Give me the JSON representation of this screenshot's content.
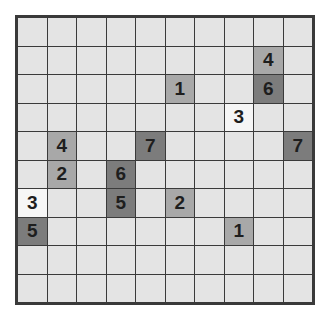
{
  "puzzle": {
    "rows": 10,
    "cols": 10,
    "colors": {
      "empty": "#e4e4e4",
      "white": "#f6f6f6",
      "medium": "#a8a8a8",
      "dark": "#7c7c7c",
      "border": "#3a3a3a"
    },
    "clues": [
      {
        "row": 1,
        "col": 8,
        "value": "4",
        "shade": "medium"
      },
      {
        "row": 2,
        "col": 5,
        "value": "1",
        "shade": "medium"
      },
      {
        "row": 2,
        "col": 8,
        "value": "6",
        "shade": "dark"
      },
      {
        "row": 3,
        "col": 7,
        "value": "3",
        "shade": "white"
      },
      {
        "row": 4,
        "col": 1,
        "value": "4",
        "shade": "medium"
      },
      {
        "row": 4,
        "col": 4,
        "value": "7",
        "shade": "dark"
      },
      {
        "row": 4,
        "col": 9,
        "value": "7",
        "shade": "dark"
      },
      {
        "row": 5,
        "col": 1,
        "value": "2",
        "shade": "medium"
      },
      {
        "row": 5,
        "col": 3,
        "value": "6",
        "shade": "dark"
      },
      {
        "row": 6,
        "col": 0,
        "value": "3",
        "shade": "white"
      },
      {
        "row": 6,
        "col": 3,
        "value": "5",
        "shade": "dark"
      },
      {
        "row": 6,
        "col": 5,
        "value": "2",
        "shade": "medium"
      },
      {
        "row": 7,
        "col": 0,
        "value": "5",
        "shade": "dark"
      },
      {
        "row": 7,
        "col": 7,
        "value": "1",
        "shade": "medium"
      }
    ]
  }
}
